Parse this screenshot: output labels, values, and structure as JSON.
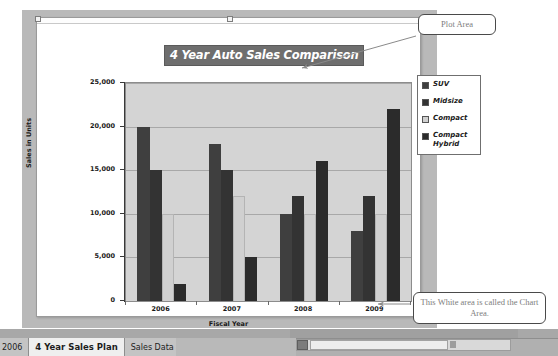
{
  "window": {
    "top_ghost_left": "",
    "top_ghost_right": ""
  },
  "chart_data": {
    "type": "bar",
    "title": "4 Year Auto Sales Comparison",
    "xlabel": "Fiscal Year",
    "ylabel": "Sales in Units",
    "categories": [
      "2006",
      "2007",
      "2008",
      "2009"
    ],
    "ylim": [
      0,
      25000
    ],
    "ytick_labels": [
      "25,000",
      "20,000",
      "15,000",
      "10,000",
      "5,000",
      "0"
    ],
    "ytick_values": [
      25000,
      20000,
      15000,
      10000,
      5000,
      0
    ],
    "grid": true,
    "legend_position": "right",
    "series": [
      {
        "name": "SUV",
        "color": "#3f3f3f",
        "values": [
          20000,
          18000,
          10000,
          8000
        ]
      },
      {
        "name": "Midsize",
        "color": "#333333",
        "values": [
          15000,
          15000,
          12000,
          12000
        ]
      },
      {
        "name": "Compact",
        "color": "#d0d0d0",
        "values": [
          10000,
          12000,
          10000,
          10000
        ]
      },
      {
        "name": "Compact Hybrid",
        "color": "#2b2b2b",
        "values": [
          2000,
          5000,
          16000,
          22000
        ]
      }
    ]
  },
  "callouts": {
    "plot_area": "Plot Area",
    "chart_area": "This White area is called the Chart Area."
  },
  "sheet_tabs": {
    "items": [
      {
        "label": "2006",
        "active": false,
        "partial": true
      },
      {
        "label": "4 Year Sales Plan",
        "active": true,
        "partial": false
      },
      {
        "label": "Sales Data",
        "active": false,
        "partial": false
      },
      {
        "label": "⤲",
        "active": false,
        "partial": false,
        "new_sheet": true
      }
    ]
  }
}
